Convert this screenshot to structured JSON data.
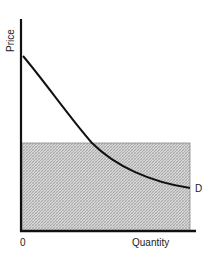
{
  "diagram": {
    "y_axis_label": "Price",
    "x_axis_label": "Quantity",
    "origin_label": "0",
    "curve_label": "D",
    "curve_name": "Demand curve",
    "shaded_region": "rectangle under price level from 0 to max quantity",
    "colors": {
      "axis": "#111111",
      "curve": "#111111",
      "shade_fill": "#cfcfcf",
      "shade_hatch": "#9a9a9a",
      "text": "#222222"
    }
  }
}
